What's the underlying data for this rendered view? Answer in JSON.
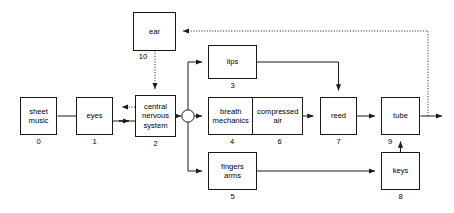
{
  "diagram": {
    "background_color": "#ffffff",
    "line_color": "#1a1a1a",
    "text_color": "#000000",
    "nodes": [
      {
        "id": "sheet-music",
        "label_lines": [
          "sheet",
          "music"
        ],
        "number": "0"
      },
      {
        "id": "eyes",
        "label_lines": [
          "eyes"
        ],
        "number": "1"
      },
      {
        "id": "central-nervous-system",
        "label_lines": [
          "central",
          "nervous",
          "system"
        ],
        "number": "2"
      },
      {
        "id": "lips",
        "label_lines": [
          "lips"
        ],
        "number": "3"
      },
      {
        "id": "breath-mechanics",
        "label_lines": [
          "breath",
          "mechanics"
        ],
        "number": "4"
      },
      {
        "id": "compressed-air",
        "label_lines": [
          "compressed",
          "air"
        ],
        "number": "6"
      },
      {
        "id": "fingers-arms",
        "label_lines": [
          "fingers",
          "arms"
        ],
        "number": "5"
      },
      {
        "id": "reed",
        "label_lines": [
          "reed"
        ],
        "number": "7"
      },
      {
        "id": "tube",
        "label_lines": [
          "tube"
        ],
        "number": "9"
      },
      {
        "id": "keys",
        "label_lines": [
          "keys"
        ],
        "number": "8"
      },
      {
        "id": "ear",
        "label_lines": [
          "ear"
        ],
        "number": "10"
      }
    ],
    "junction": {
      "id": "summing-junction",
      "shape": "circle"
    },
    "edges": [
      {
        "from": "sheet-music",
        "to": "eyes",
        "style": "solid"
      },
      {
        "from": "eyes",
        "to": "central-nervous-system",
        "style": "solid"
      },
      {
        "from": "central-nervous-system",
        "to": "eyes",
        "style": "dotted"
      },
      {
        "from": "ear",
        "to": "central-nervous-system",
        "style": "dotted"
      },
      {
        "from": "central-nervous-system",
        "to": "summing-junction",
        "style": "solid"
      },
      {
        "from": "summing-junction",
        "to": "lips",
        "style": "solid"
      },
      {
        "from": "summing-junction",
        "to": "breath-mechanics",
        "style": "solid"
      },
      {
        "from": "summing-junction",
        "to": "fingers-arms",
        "style": "solid"
      },
      {
        "from": "breath-mechanics",
        "to": "compressed-air",
        "style": "adjacent"
      },
      {
        "from": "compressed-air",
        "to": "reed",
        "style": "solid"
      },
      {
        "from": "lips",
        "to": "reed",
        "style": "solid"
      },
      {
        "from": "fingers-arms",
        "to": "keys",
        "style": "solid"
      },
      {
        "from": "keys",
        "to": "tube",
        "style": "solid"
      },
      {
        "from": "reed",
        "to": "tube",
        "style": "solid"
      },
      {
        "from": "tube",
        "to": "output",
        "style": "solid"
      },
      {
        "from": "tube-output",
        "to": "ear",
        "style": "dotted"
      }
    ]
  }
}
